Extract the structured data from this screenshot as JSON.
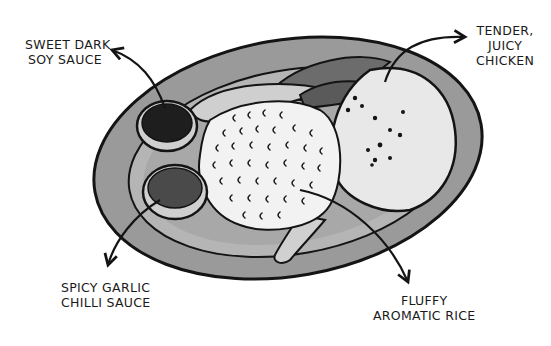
{
  "labels": {
    "soy_sauce": {
      "line1": "SWEET DARK",
      "line2": "SOY SAUCE"
    },
    "chicken": {
      "line1": "TENDER,",
      "line2": "JUICY",
      "line3": "CHICKEN"
    },
    "chilli_sauce": {
      "line1": "SPICY GARLIC",
      "line2": "CHILLI SAUCE"
    },
    "rice": {
      "line1": "FLUFFY",
      "line2": "AROMATIC RICE"
    }
  },
  "colors": {
    "plate_outer": "#9a9a9a",
    "plate_inner": "#b8b8b8",
    "rice": "#f2f2f2",
    "chicken": "#e6e6e6",
    "soy": "#1e1e1e",
    "chilli": "#4a4a4a",
    "greens": "#6c6c6c",
    "ink": "#141414"
  }
}
